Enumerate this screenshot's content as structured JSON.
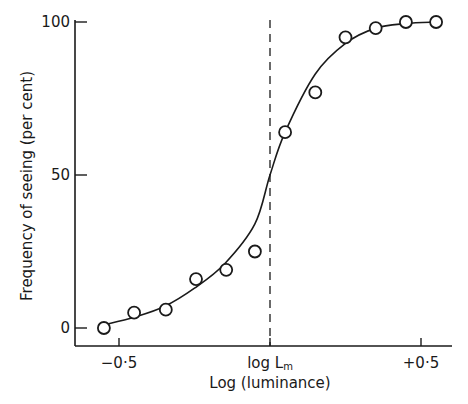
{
  "chart_data": {
    "type": "scatter",
    "title": "",
    "xlabel": "Log (luminance)",
    "ylabel": "Frequency of seeing (per cent)",
    "xticks": [
      {
        "value": -0.5,
        "label": "−0·5"
      },
      {
        "value": 0,
        "label": "log L",
        "sub": "m"
      },
      {
        "value": 0.5,
        "label": "+0·5"
      }
    ],
    "yticks": [
      {
        "value": 0,
        "label": "0"
      },
      {
        "value": 50,
        "label": "50"
      },
      {
        "value": 100,
        "label": "100"
      }
    ],
    "xlim": [
      -0.65,
      0.62
    ],
    "ylim": [
      -6,
      100
    ],
    "grid": false,
    "reference_line": {
      "x": 0,
      "style": "dashed",
      "label": "log Lm"
    },
    "series": [
      {
        "name": "observed",
        "marker": "open-circle",
        "x": [
          -0.55,
          -0.45,
          -0.345,
          -0.245,
          -0.145,
          -0.05,
          0.05,
          0.15,
          0.25,
          0.35,
          0.45,
          0.55
        ],
        "y": [
          0,
          5,
          6,
          16,
          19,
          25,
          64,
          77,
          95,
          98,
          100,
          100
        ]
      },
      {
        "name": "fitted curve",
        "marker": "none",
        "x": [
          -0.55,
          -0.45,
          -0.35,
          -0.25,
          -0.15,
          -0.05,
          0,
          0.05,
          0.15,
          0.25,
          0.35,
          0.45,
          0.55
        ],
        "y": [
          1,
          3.5,
          7,
          13,
          21,
          34,
          50,
          64,
          83,
          93,
          98,
          99.5,
          100
        ]
      }
    ]
  }
}
